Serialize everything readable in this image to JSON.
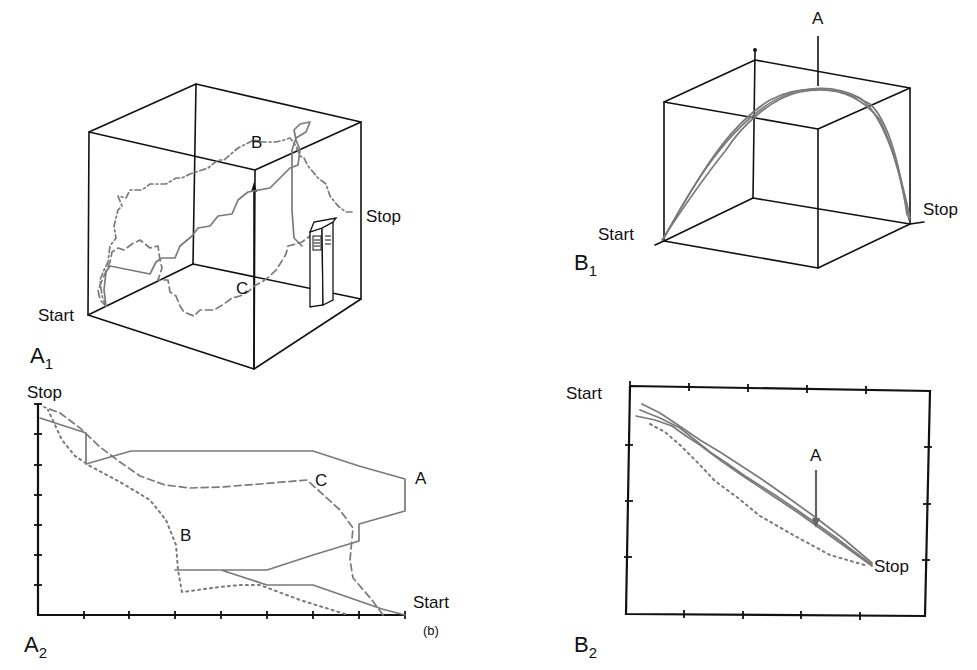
{
  "figure": {
    "caption_marker": "(b)",
    "colors": {
      "frame": "#111111",
      "trace": "#7a7a7a",
      "background": "#ffffff"
    }
  },
  "panels": {
    "A1": {
      "label": "A",
      "subscript": "1",
      "start_label": "Start",
      "stop_label": "Stop",
      "path_labels": {
        "B": "B",
        "C": "C"
      },
      "traces": [
        {
          "name": "A",
          "style": "solid"
        },
        {
          "name": "B",
          "style": "dash-dot"
        },
        {
          "name": "C",
          "style": "dashed"
        }
      ]
    },
    "A2": {
      "label": "A",
      "subscript": "2",
      "start_label": "Start",
      "stop_label": "Stop",
      "path_labels": {
        "A": "A",
        "B": "B",
        "C": "C"
      },
      "caption": "(b)"
    },
    "B1": {
      "label": "B",
      "subscript": "1",
      "start_label": "Start",
      "stop_label": "Stop",
      "marker_label": "A"
    },
    "B2": {
      "label": "B",
      "subscript": "2",
      "start_label": "Start",
      "stop_label": "Stop",
      "marker_label": "A"
    }
  }
}
